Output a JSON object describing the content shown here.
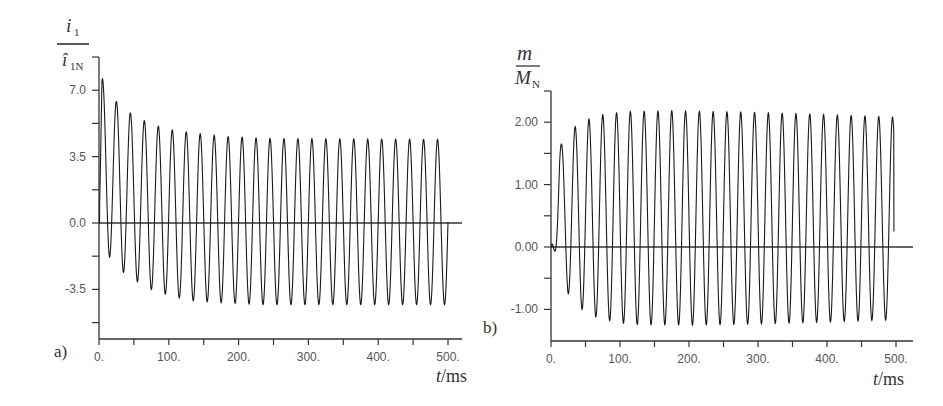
{
  "chart_data": [
    {
      "type": "line",
      "panel": "a)",
      "title": "",
      "xlabel": "t/ms",
      "xlabel_italic_part": "t",
      "xlabel_unit_part": "/ms",
      "ylabel": {
        "numerator": "i1",
        "numerator_main": "i",
        "numerator_sub": "1",
        "denominator": "î1N",
        "denominator_main": "î",
        "denominator_sub": "1N"
      },
      "xlim": [
        0,
        520
      ],
      "ylim": [
        -6.1,
        8.75
      ],
      "x_ticks": [
        0,
        50,
        100,
        150,
        200,
        250,
        300,
        350,
        400,
        450,
        500
      ],
      "x_tick_labels": [
        {
          "value": 0,
          "label": "0."
        },
        {
          "value": 100,
          "label": "100."
        },
        {
          "value": 200,
          "label": "200."
        },
        {
          "value": 300,
          "label": "300."
        },
        {
          "value": 400,
          "label": "400."
        },
        {
          "value": 500,
          "label": "500."
        }
      ],
      "y_ticks": [
        -5.25,
        -3.5,
        -1.75,
        0,
        1.75,
        3.5,
        5.25,
        7.0,
        8.75
      ],
      "y_tick_labels": [
        {
          "value": 7.0,
          "label": "7.0"
        },
        {
          "value": 3.5,
          "label": "3.5"
        },
        {
          "value": 0,
          "label": "0.0"
        },
        {
          "value": -3.5,
          "label": "-3.5"
        }
      ],
      "zero_line": true,
      "grid": false,
      "signal": {
        "period_ms": 20,
        "t_end_ms": 500,
        "peak_envelope": [
          [
            5,
            7.6
          ],
          [
            25,
            6.4
          ],
          [
            45,
            5.8
          ],
          [
            65,
            5.4
          ],
          [
            85,
            5.1
          ],
          [
            105,
            4.9
          ],
          [
            125,
            4.8
          ],
          [
            145,
            4.7
          ],
          [
            185,
            4.55
          ],
          [
            245,
            4.45
          ],
          [
            500,
            4.4
          ]
        ],
        "trough_envelope": [
          [
            0,
            0
          ],
          [
            15,
            -1.8
          ],
          [
            35,
            -2.6
          ],
          [
            55,
            -3.1
          ],
          [
            75,
            -3.5
          ],
          [
            95,
            -3.75
          ],
          [
            115,
            -3.95
          ],
          [
            135,
            -4.1
          ],
          [
            175,
            -4.2
          ],
          [
            235,
            -4.3
          ],
          [
            500,
            -4.3
          ]
        ]
      }
    },
    {
      "type": "line",
      "panel": "b)",
      "title": "",
      "xlabel": "t/ms",
      "xlabel_italic_part": "t",
      "xlabel_unit_part": "/ms",
      "ylabel": {
        "numerator": "m",
        "denominator": "MN",
        "denominator_main": "M",
        "denominator_sub": "N"
      },
      "xlim": [
        0,
        520
      ],
      "ylim": [
        -1.5,
        2.5
      ],
      "x_ticks": [
        0,
        50,
        100,
        150,
        200,
        250,
        300,
        350,
        400,
        450,
        500
      ],
      "x_tick_labels": [
        {
          "value": 0,
          "label": "0."
        },
        {
          "value": 100,
          "label": "100."
        },
        {
          "value": 200,
          "label": "200."
        },
        {
          "value": 300,
          "label": "300."
        },
        {
          "value": 400,
          "label": "400."
        },
        {
          "value": 500,
          "label": "500."
        }
      ],
      "y_ticks": [
        -1.5,
        -1.0,
        -0.5,
        0,
        0.5,
        1.0,
        1.5,
        2.0,
        2.5
      ],
      "y_tick_labels": [
        {
          "value": 2.0,
          "label": "2.00"
        },
        {
          "value": 1.0,
          "label": "1.00"
        },
        {
          "value": 0,
          "label": "0.00"
        },
        {
          "value": -1.0,
          "label": "-1.00"
        }
      ],
      "zero_line": true,
      "grid": false,
      "signal": {
        "period_ms": 20,
        "t_end_ms": 497,
        "end_value": 0.25,
        "peak_envelope": [
          [
            15,
            1.65
          ],
          [
            35,
            1.93
          ],
          [
            55,
            2.05
          ],
          [
            75,
            2.12
          ],
          [
            95,
            2.15
          ],
          [
            115,
            2.17
          ],
          [
            175,
            2.18
          ],
          [
            275,
            2.16
          ],
          [
            375,
            2.13
          ],
          [
            495,
            2.08
          ]
        ],
        "trough_envelope": [
          [
            0,
            0
          ],
          [
            25,
            -0.75
          ],
          [
            45,
            -1.0
          ],
          [
            65,
            -1.12
          ],
          [
            85,
            -1.18
          ],
          [
            105,
            -1.22
          ],
          [
            125,
            -1.24
          ],
          [
            205,
            -1.25
          ],
          [
            305,
            -1.23
          ],
          [
            405,
            -1.2
          ],
          [
            485,
            -1.17
          ]
        ]
      }
    }
  ]
}
